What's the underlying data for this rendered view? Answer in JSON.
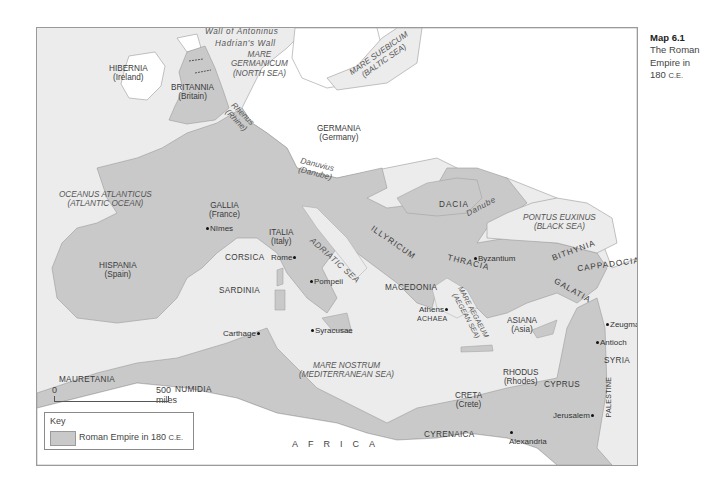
{
  "caption": {
    "number": "Map 6.1",
    "title_line1": "The Roman",
    "title_line2": "Empire in",
    "title_line3": "180",
    "era": "C.E."
  },
  "colors": {
    "sea": "#ececec",
    "empire": "#c9c9c9",
    "non_empire_land": "#ffffff",
    "border": "#9a9a9a",
    "text": "#3a3a3a"
  },
  "walls": {
    "antoninus": "Wall of Antoninus",
    "hadrian": "Hadrian's Wall"
  },
  "seas": {
    "germanicum": "MARE",
    "germanicum2": "GERMANICUM",
    "germanicum_en": "(NORTH SEA)",
    "suebicum": "MARE SUEBICUM",
    "suebicum_en": "(BALTIC SEA)",
    "atlanticus": "OCEANUS ATLANTICUS",
    "atlanticus_en": "(ATLANTIC OCEAN)",
    "adriatic": "ADRIATIC SEA",
    "euxinus": "PONTUS EUXINUS",
    "euxinus_en": "(BLACK SEA)",
    "aegaeum": "MARE AEGAEUM",
    "aegaeum_en": "(AEGEAN SEA)",
    "nostrum": "MARE NOSTRUM",
    "nostrum_en": "(MEDITERRANEAN SEA)"
  },
  "rivers": {
    "rhenus": "Rhenus",
    "rhenus_en": "(Rhine)",
    "danuvius": "Danuvius",
    "danuvius_en": "(Danube)",
    "danube": "Danube"
  },
  "regions": {
    "hibernia": "HIBERNIA",
    "hibernia_en": "(Ireland)",
    "britannia": "BRITANNIA",
    "britannia_en": "(Britain)",
    "germania": "GERMANIA",
    "germania_en": "(Germany)",
    "gallia": "GALLIA",
    "gallia_en": "(France)",
    "hispania": "HISPANIA",
    "hispania_en": "(Spain)",
    "italia": "ITALIA",
    "italia_en": "(Italy)",
    "corsica": "CORSICA",
    "sardinia": "SARDINIA",
    "dacia": "DACIA",
    "illyricum": "ILLYRICUM",
    "thracia": "THRACIA",
    "macedonia": "MACEDONIA",
    "achaea": "ACHAEA",
    "bithynia": "BITHYNIA",
    "cappadocia": "CAPPADOCIA",
    "galatia": "GALATIA",
    "asiana": "ASIANA",
    "asiana_en": "(Asia)",
    "rhodus": "RHODUS",
    "rhodus_en": "(Rhodes)",
    "creta": "CRETA",
    "creta_en": "(Crete)",
    "cyprus": "CYPRUS",
    "syria": "SYRIA",
    "palestine": "PALESTINE",
    "mauretania": "MAURETANIA",
    "numidia": "NUMIDIA",
    "cyrenaica": "CYRENAICA",
    "africa": "AFRICA"
  },
  "cities": {
    "nimes": "Nîmes",
    "rome": "Rome",
    "pompeii": "Pompeii",
    "syracusae": "Syracusae",
    "carthage": "Carthage",
    "athens": "Athens",
    "byzantium": "Byzantium",
    "zeugma": "Zeugma",
    "antioch": "Antioch",
    "jerusalem": "Jerusalem",
    "alexandria": "Alexandria"
  },
  "scale": {
    "start": "0",
    "end": "500 miles"
  },
  "legend": {
    "title": "Key",
    "label": "Roman Empire in 180",
    "era": "C.E."
  }
}
